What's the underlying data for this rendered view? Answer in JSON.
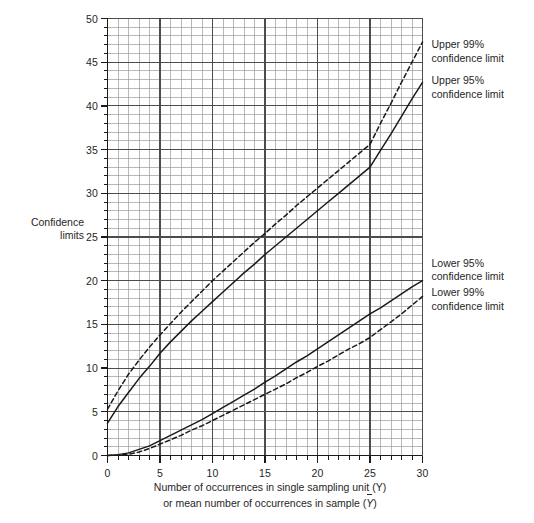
{
  "chart_data": {
    "type": "line",
    "title": "",
    "xlabel_line1": "Number of occurrences in single sampling unit (Y)",
    "xlabel_line2_prefix": "or mean number of occurrences in sample (",
    "xlabel_line2_symbol": "Y",
    "xlabel_line2_suffix": ")",
    "ylabel_line1": "Confidence",
    "ylabel_line2": "limits",
    "xlim": [
      0,
      30
    ],
    "ylim": [
      0,
      50
    ],
    "xticks": [
      0,
      5,
      10,
      15,
      20,
      25,
      30
    ],
    "yticks": [
      0,
      5,
      10,
      15,
      20,
      25,
      30,
      35,
      40,
      45,
      50
    ],
    "xtick_labels": [
      "0",
      "5",
      "10",
      "15",
      "20",
      "25",
      "30"
    ],
    "ytick_labels": [
      "0",
      "5",
      "10",
      "15",
      "20",
      "25",
      "30",
      "35",
      "40",
      "45",
      "50"
    ],
    "grid": true,
    "grid_major_step_x": 5,
    "grid_major_step_y": 5,
    "grid_minor_step_x": 1,
    "grid_minor_step_y": 1,
    "grid_minor_color": "#9a9a9a",
    "grid_major_color": "#4d4d4d",
    "axis_color": "#1a1a1a",
    "series": [
      {
        "name": "Upper 99% confidence limit",
        "style": "dashed",
        "color": "#1a1a1a",
        "x": [
          0,
          1,
          2,
          3,
          4,
          5,
          6,
          7,
          8,
          9,
          10,
          11,
          12,
          13,
          14,
          15,
          16,
          17,
          18,
          19,
          20,
          21,
          22,
          23,
          24,
          25,
          26,
          27,
          28,
          29,
          30
        ],
        "y": [
          5.3,
          7.4,
          9.3,
          10.9,
          12.4,
          13.8,
          15.1,
          16.4,
          17.6,
          18.8,
          20.0,
          21.1,
          22.2,
          23.3,
          24.4,
          25.4,
          26.5,
          27.5,
          28.6,
          29.6,
          30.6,
          31.6,
          32.6,
          33.6,
          34.6,
          35.6,
          38.0,
          40.3,
          42.7,
          45.0,
          47.3
        ]
      },
      {
        "name": "Upper 95% confidence limit",
        "style": "solid",
        "color": "#1a1a1a",
        "x": [
          0,
          1,
          2,
          3,
          4,
          5,
          6,
          7,
          8,
          9,
          10,
          11,
          12,
          13,
          14,
          15,
          16,
          17,
          18,
          19,
          20,
          21,
          22,
          23,
          24,
          25,
          26,
          27,
          28,
          29,
          30
        ],
        "y": [
          3.7,
          5.6,
          7.2,
          8.8,
          10.2,
          11.7,
          13.0,
          14.2,
          15.4,
          16.5,
          17.6,
          18.7,
          19.8,
          20.9,
          21.9,
          23.0,
          24.0,
          25.0,
          26.0,
          27.0,
          28.0,
          29.0,
          30.0,
          31.0,
          32.0,
          33.0,
          34.9,
          36.8,
          38.8,
          40.8,
          42.7
        ]
      },
      {
        "name": "Lower 95% confidence limit",
        "style": "solid",
        "color": "#1a1a1a",
        "x": [
          0,
          1,
          2,
          3,
          4,
          5,
          6,
          7,
          8,
          9,
          10,
          11,
          12,
          13,
          14,
          15,
          16,
          17,
          18,
          19,
          20,
          21,
          22,
          23,
          24,
          25,
          26,
          27,
          28,
          29,
          30
        ],
        "y": [
          0.0,
          0.1,
          0.3,
          0.7,
          1.1,
          1.7,
          2.3,
          2.9,
          3.5,
          4.1,
          4.8,
          5.5,
          6.2,
          6.9,
          7.6,
          8.4,
          9.1,
          9.9,
          10.7,
          11.4,
          12.2,
          13.0,
          13.8,
          14.6,
          15.4,
          16.2,
          16.9,
          17.7,
          18.5,
          19.3,
          20.0
        ]
      },
      {
        "name": "Lower 99% confidence limit",
        "style": "dashed",
        "color": "#1a1a1a",
        "x": [
          0,
          1,
          2,
          3,
          4,
          5,
          6,
          7,
          8,
          9,
          10,
          11,
          12,
          13,
          14,
          15,
          16,
          17,
          18,
          19,
          20,
          21,
          22,
          23,
          24,
          25,
          26,
          27,
          28,
          29,
          30
        ],
        "y": [
          0.0,
          0.05,
          0.15,
          0.4,
          0.8,
          1.3,
          1.8,
          2.3,
          2.9,
          3.4,
          4.0,
          4.6,
          5.2,
          5.8,
          6.4,
          7.0,
          7.6,
          8.2,
          8.9,
          9.5,
          10.2,
          10.8,
          11.5,
          12.2,
          12.8,
          13.5,
          14.4,
          15.3,
          16.2,
          17.2,
          18.2
        ]
      }
    ],
    "annotations": [
      {
        "id": "upper99",
        "line1": "Upper 99%",
        "line2": "confidence limit"
      },
      {
        "id": "upper95",
        "line1": "Upper 95%",
        "line2": "confidence limit"
      },
      {
        "id": "lower95",
        "line1": "Lower 95%",
        "line2": "confidence limit"
      },
      {
        "id": "lower99",
        "line1": "Lower 99%",
        "line2": "confidence limit"
      }
    ]
  }
}
